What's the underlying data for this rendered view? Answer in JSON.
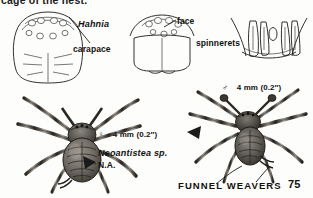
{
  "page": {
    "clipped_running_text": "cage of the nest.",
    "footer_title": "FUNNEL WEAVERS",
    "page_number": "75",
    "background_color": "#fdfdfb",
    "ink_color": "#1b1b1b"
  },
  "diagrams": [
    {
      "id": "carapace",
      "name": "carapace-diagram",
      "label": "carapace",
      "genus_label": "Hahnia",
      "view": "dorsal carapace outline with eight eyes in two rows"
    },
    {
      "id": "face",
      "name": "face-diagram",
      "label": "face",
      "view": "anterior face with eye group and chelicerae"
    },
    {
      "id": "spinnerets",
      "name": "spinnerets-diagram",
      "label": "spinnerets",
      "view": "transverse row of six elongate spinnerets"
    }
  ],
  "specimens": [
    {
      "id": "female",
      "name": "female-spider-illustration",
      "sex_symbol": "♀",
      "measurement": "4 mm (0.2″)",
      "species": "Neoantistea sp.",
      "range": "N.A."
    },
    {
      "id": "male",
      "name": "male-spider-illustration",
      "sex_symbol": "♂",
      "measurement": "4 mm (0.2″)"
    }
  ],
  "pointers": [
    {
      "name": "pointer-female-abdomen"
    },
    {
      "name": "pointer-male-left"
    },
    {
      "name": "pointer-footer"
    }
  ]
}
